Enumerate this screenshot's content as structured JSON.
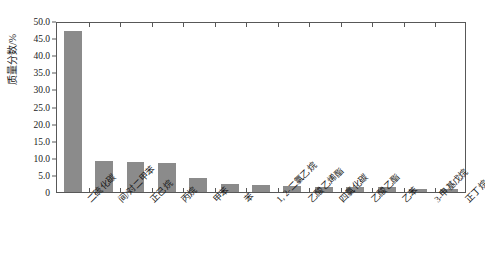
{
  "chart_data": {
    "type": "bar",
    "title": "",
    "subtitle": "",
    "xlabel": "",
    "ylabel": "质量分数/%",
    "ylim": [
      0,
      50
    ],
    "yticks": [
      "0",
      "5.0",
      "10.0",
      "15.0",
      "20.0",
      "25.0",
      "30.0",
      "35.0",
      "40.0",
      "45.0",
      "50.0"
    ],
    "ytick_values": [
      0,
      5,
      10,
      15,
      20,
      25,
      30,
      35,
      40,
      45,
      50
    ],
    "grid": false,
    "legend": "none",
    "bar_color": "#8b8b8b",
    "axis_color": "#585858",
    "categories": [
      "二硫化碳",
      "间/对二甲苯",
      "正己烷",
      "丙烷",
      "甲苯",
      "苯",
      "1, 2-二氯乙烷",
      "乙酸乙烯酯",
      "四氯化碳",
      "乙酸乙酯",
      "乙苯",
      "3-甲基戊烷",
      "正丁烷"
    ],
    "values": [
      47.0,
      9.0,
      8.8,
      8.5,
      4.2,
      2.3,
      2.0,
      1.7,
      1.6,
      1.5,
      1.4,
      0.9,
      0.8
    ]
  }
}
